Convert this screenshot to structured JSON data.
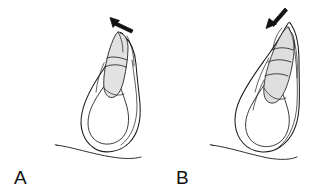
{
  "figure": {
    "background_color": "#ffffff",
    "ink_color": "#1a1a1a",
    "shading_color": "#e2e2e2",
    "arrow_color": "#111111",
    "width": 322,
    "height": 194,
    "style": "line-drawing"
  },
  "panels": [
    {
      "id": "panel-a",
      "label": "A",
      "label_x": 14,
      "label_y": 184,
      "arrow": {
        "name": "motion-arrow",
        "direction": "up-left",
        "tip_x": 110,
        "tip_y": 17,
        "tail_x": 133,
        "tail_y": 30
      },
      "shaded_lobe": {
        "name": "shaded-lobe",
        "fill": "#e2e2e2",
        "orientation": "tilted-right"
      },
      "outline": {
        "name": "body-outline",
        "shape": "teardrop-loop"
      },
      "baseline": {
        "name": "baseline-curve",
        "start_x": 56,
        "start_y": 145,
        "end_x": 132,
        "end_y": 157
      }
    },
    {
      "id": "panel-b",
      "label": "B",
      "label_x": 176,
      "label_y": 184,
      "arrow": {
        "name": "motion-arrow",
        "direction": "down-left",
        "tip_x": 266,
        "tip_y": 28,
        "tail_x": 285,
        "tail_y": 9
      },
      "shaded_lobe": {
        "name": "shaded-lobe",
        "fill": "#dedede",
        "orientation": "tilted-right-segmented"
      },
      "outline": {
        "name": "body-outline",
        "shape": "teardrop-loop"
      },
      "baseline": {
        "name": "baseline-curve",
        "start_x": 50,
        "start_y": 145,
        "end_x": 128,
        "end_y": 158
      }
    }
  ]
}
